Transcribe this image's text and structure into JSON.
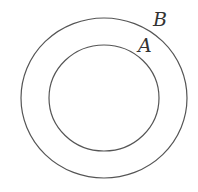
{
  "diagram": {
    "type": "concentric-circles",
    "stroke_color": "#555555",
    "outer_circle": {
      "label": "B",
      "cx": 104,
      "cy": 98,
      "rx": 83,
      "ry": 80
    },
    "inner_circle": {
      "label": "A",
      "cx": 104,
      "cy": 98,
      "rx": 55,
      "ry": 53
    }
  }
}
